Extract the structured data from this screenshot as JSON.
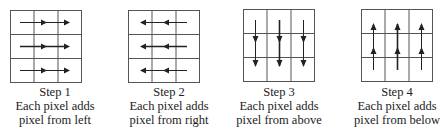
{
  "diagram": {
    "grid_size": 3,
    "line_color": "#555555",
    "arrow_color": "#222222",
    "steps": [
      {
        "title": "Step 1",
        "line1": "Each pixel adds",
        "line2": "pixel from left",
        "direction": "right"
      },
      {
        "title": "Step 2",
        "line1": "Each pixel adds",
        "line2": "pixel from right",
        "direction": "left"
      },
      {
        "title": "Step 3",
        "line1": "Each pixel adds",
        "line2": "pixel from above",
        "direction": "down"
      },
      {
        "title": "Step 4",
        "line1": "Each pixel adds",
        "line2": "pixel from below",
        "direction": "up"
      }
    ]
  }
}
